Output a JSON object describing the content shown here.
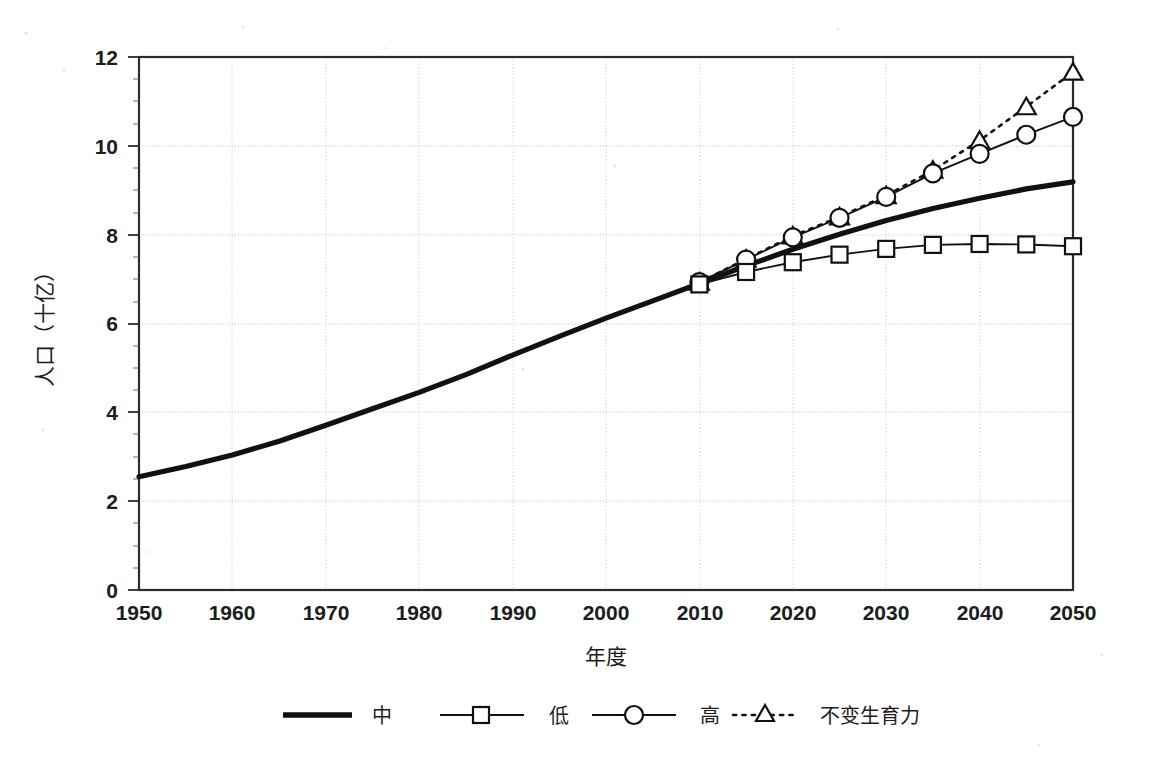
{
  "chart_data": {
    "type": "line",
    "title": "",
    "xlabel": "年度",
    "ylabel": "人口（十亿）",
    "xlim": [
      1950,
      2050
    ],
    "ylim": [
      0,
      12
    ],
    "ytick_labels": [
      "0",
      "2",
      "4",
      "6",
      "8",
      "10",
      "12"
    ],
    "yticks": [
      0,
      2,
      4,
      6,
      8,
      10,
      12
    ],
    "xtick_labels": [
      "1950",
      "1960",
      "1970",
      "1980",
      "1990",
      "2000",
      "2010",
      "2020",
      "2030",
      "2040",
      "2050"
    ],
    "xticks": [
      1950,
      1960,
      1970,
      1980,
      1990,
      2000,
      2010,
      2020,
      2030,
      2040,
      2050
    ],
    "grid": "horizontal-and-vertical-dotted",
    "legend_position": "bottom",
    "series": [
      {
        "name": "中",
        "style": "thick-solid-no-marker",
        "marker": "none",
        "x": [
          1950,
          1955,
          1960,
          1965,
          1970,
          1975,
          1980,
          1985,
          1990,
          1995,
          2000,
          2005,
          2010,
          2015,
          2020,
          2025,
          2030,
          2035,
          2040,
          2045,
          2050
        ],
        "values": [
          2.55,
          2.78,
          3.04,
          3.35,
          3.71,
          4.08,
          4.45,
          4.85,
          5.29,
          5.71,
          6.12,
          6.51,
          6.9,
          7.3,
          7.67,
          8.01,
          8.32,
          8.59,
          8.82,
          9.03,
          9.19
        ]
      },
      {
        "name": "低",
        "style": "thin-solid-square-marker",
        "marker": "square",
        "x": [
          2010,
          2015,
          2020,
          2025,
          2030,
          2035,
          2040,
          2045,
          2050
        ],
        "values": [
          6.88,
          7.16,
          7.38,
          7.55,
          7.68,
          7.77,
          7.79,
          7.78,
          7.74
        ]
      },
      {
        "name": "高",
        "style": "thin-solid-circle-marker",
        "marker": "circle",
        "x": [
          2010,
          2015,
          2020,
          2025,
          2030,
          2035,
          2040,
          2045,
          2050
        ],
        "values": [
          6.93,
          7.44,
          7.94,
          8.38,
          8.85,
          9.38,
          9.82,
          10.25,
          10.65
        ]
      },
      {
        "name": "不变生育力",
        "style": "dotted-triangle-marker",
        "marker": "triangle",
        "x": [
          2010,
          2015,
          2020,
          2025,
          2030,
          2035,
          2040,
          2045,
          2050
        ],
        "values": [
          6.93,
          7.45,
          7.97,
          8.4,
          8.88,
          9.45,
          10.12,
          10.88,
          11.66
        ]
      }
    ]
  },
  "legend": {
    "items": [
      {
        "label": "中",
        "marker": "none"
      },
      {
        "label": "低",
        "marker": "square"
      },
      {
        "label": "高",
        "marker": "circle"
      },
      {
        "label": "不变生育力",
        "marker": "triangle"
      }
    ]
  }
}
